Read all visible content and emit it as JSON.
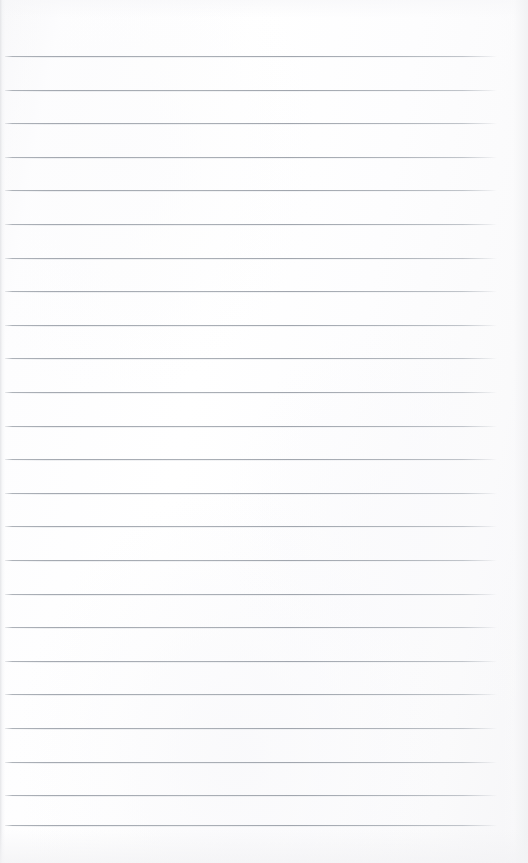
{
  "document": {
    "kind": "blank-ruled-notebook-page",
    "title": "",
    "visible_text": "",
    "page_number": "",
    "has_written_content": false,
    "has_header": false,
    "has_footer": false,
    "has_margin_rule": false
  },
  "page": {
    "width": 528,
    "height": 863,
    "background_color": "#fdfdfe",
    "edge_tint_color": "#f2f3f5"
  },
  "ruling": {
    "line_color": "#a6abb3",
    "line_count": 23,
    "first_line_y": 56,
    "line_spacing": 33.6,
    "line_start_x": 5,
    "line_end_x": 497,
    "line_thickness": 1,
    "lines_y": [
      56.0,
      89.6,
      123.2,
      156.8,
      190.4,
      224.0,
      257.6,
      291.2,
      324.8,
      358.4,
      392.0,
      425.6,
      459.2,
      492.8,
      526.4,
      560.0,
      593.6,
      627.2,
      660.8,
      694.4,
      728.0,
      761.6,
      795.2
    ],
    "extra_bottom_line_y": 824.8
  }
}
